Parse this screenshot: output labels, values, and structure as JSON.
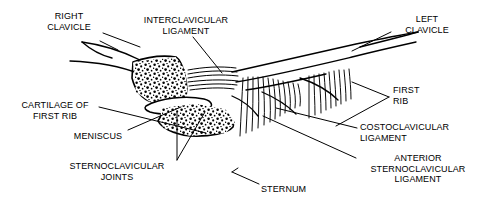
{
  "figure": {
    "style": "black-and-white line art with leader lines",
    "ink_color": "#000000",
    "background_color": "#ffffff"
  },
  "labels": [
    {
      "id": "right-clavicle",
      "text": "RIGHT\nCLAVICLE"
    },
    {
      "id": "interclavicular-ligament",
      "text": "INTERCLAVICULAR\nLIGAMENT"
    },
    {
      "id": "left-clavicle",
      "text": "LEFT\nCLAVICLE"
    },
    {
      "id": "first-rib",
      "text": "FIRST\nRIB"
    },
    {
      "id": "cartilage-of-first-rib",
      "text": "CARTILAGE OF\nFIRST RIB"
    },
    {
      "id": "meniscus",
      "text": "MENISCUS"
    },
    {
      "id": "sternoclavicular-joints",
      "text": "STERNOCLAVICULAR\nJOINTS"
    },
    {
      "id": "costoclavicular-ligament",
      "text": "COSTOCLAVICULAR\nLIGAMENT"
    },
    {
      "id": "anterior-sternoclavicular-ligament",
      "text": "ANTERIOR\nSTERNOCLAVICULAR\nLIGAMENT"
    },
    {
      "id": "sternum",
      "text": "STERNUM"
    }
  ]
}
